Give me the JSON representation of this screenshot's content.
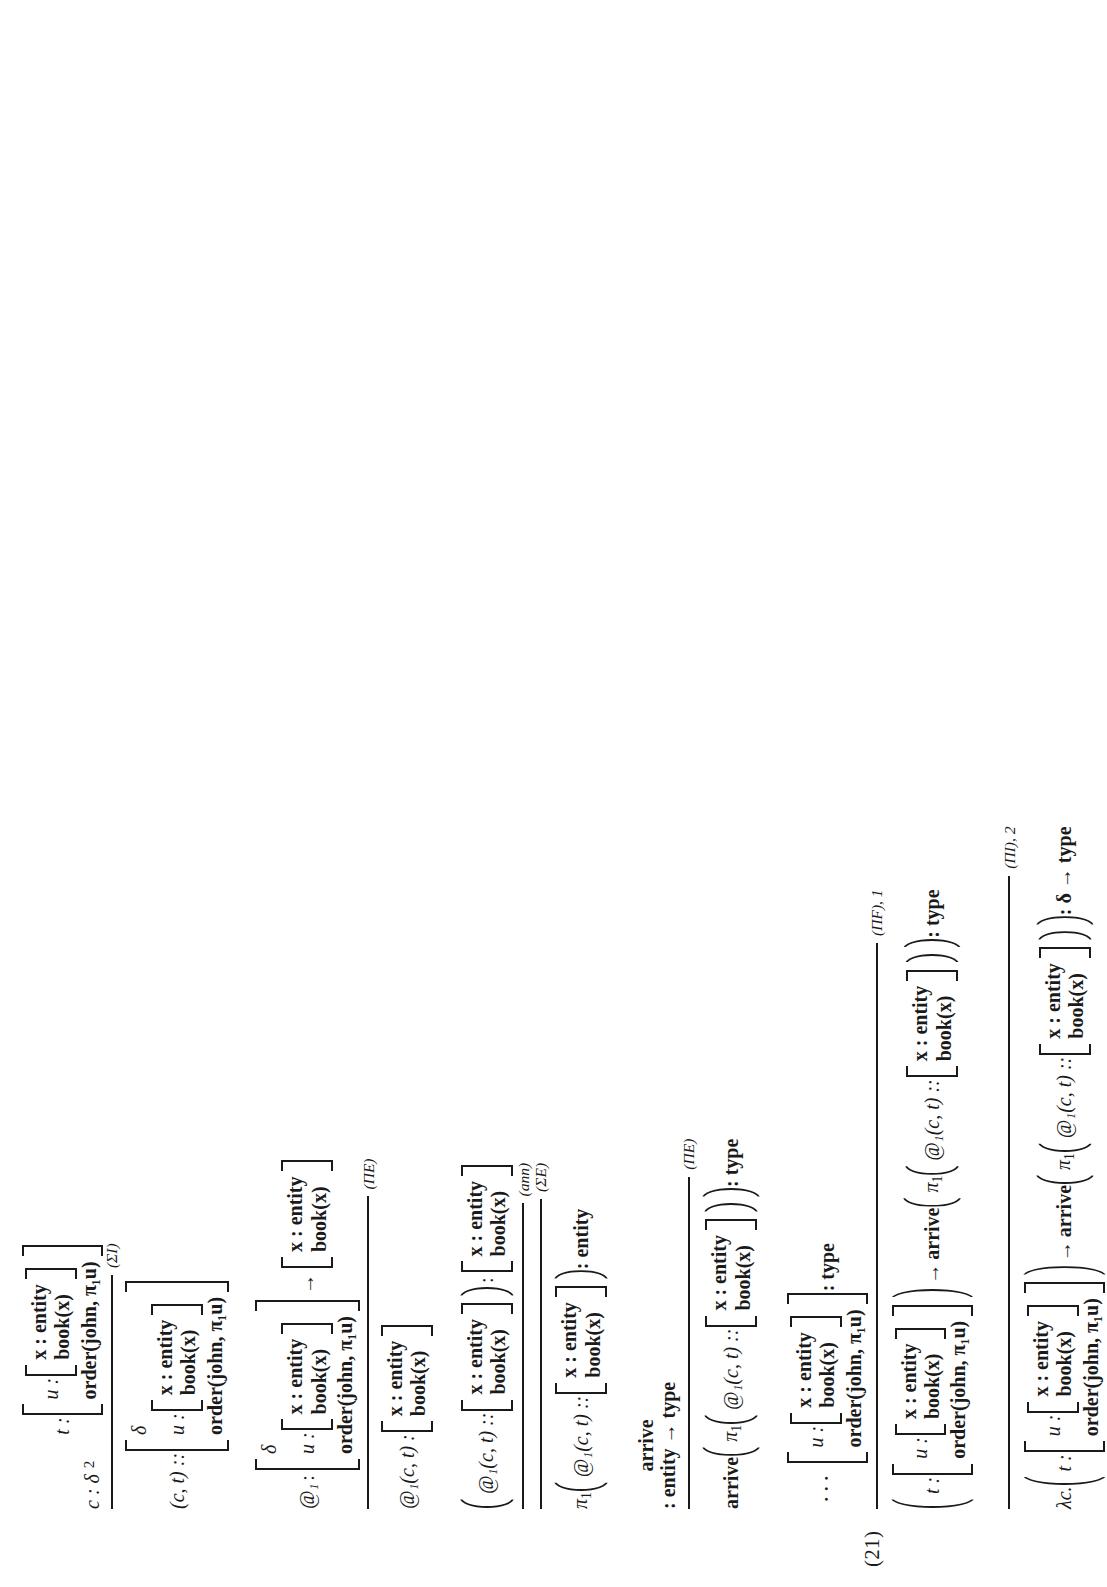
{
  "equation": {
    "number": "(21)"
  },
  "symbols": {
    "colon": ":",
    "dcolon": "::",
    "arrow": "→",
    "comma": ",",
    "delta": "δ",
    "lambda": "λc.",
    "pi1": "π",
    "pi_sub": "1",
    "at": "@",
    "at_sub": "1",
    "dots": "⋅⋅⋅"
  },
  "vars": {
    "x": "x",
    "u": "u",
    "t": "t",
    "c": "c"
  },
  "types": {
    "entity": "entity",
    "type": "type",
    "book_x": "book(x)",
    "order_john": "order(john, π₁u)",
    "arrive": "arrive"
  },
  "rules": {
    "sigma_intro": "(ΣI)",
    "sigma_elim": "(ΣE)",
    "pi_elim": "(ΠE)",
    "pi_elim2": "(ΠE)",
    "pi_form": "(ΠF), 1",
    "pi_intro": "(ΠI), 2",
    "annotation": "(ann)"
  },
  "markers": {
    "one": "1",
    "two": "2"
  },
  "judgments": {
    "hyp_c": "c : δ",
    "hyp_t_label": "t :",
    "pair_ct": "(c, t) ::",
    "at_applied": "@₁(c, t) :",
    "at_annotated": "@₁(c, t) ::",
    "pi_entity": ": entity",
    "arrive_sig": ": entity → type",
    "arrive_type": ": type",
    "concl_type": ": type",
    "final_type": ": δ → type",
    "at_head": "@₁",
    "at_head_colon": ":"
  },
  "record_fields": {
    "x_entity": "x : entity",
    "book": "book(x)",
    "u_label": "u :",
    "order": "order(john, π₁u)",
    "delta": "δ",
    "t_label": "t :",
    "t_label2": "t :"
  },
  "colors": {
    "ink": "#1a1a1a",
    "paper": "#ffffff"
  }
}
